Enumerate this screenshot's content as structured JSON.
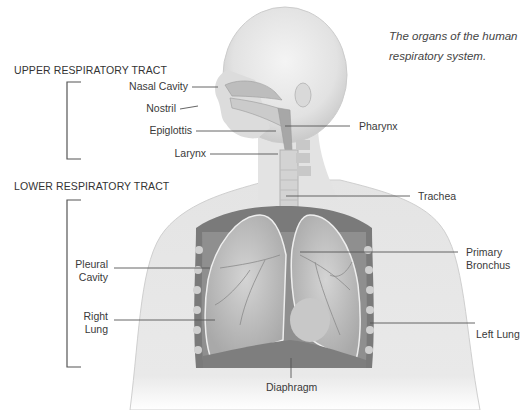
{
  "caption": {
    "line1": "The organs of the human",
    "line2": "respiratory system."
  },
  "sections": {
    "upper": "UPPER RESPIRATORY TRACT",
    "lower": "LOWER RESPIRATORY TRACT"
  },
  "labels": {
    "nasal_cavity": "Nasal Cavity",
    "nostril": "Nostril",
    "epiglottis": "Epiglottis",
    "larynx": "Larynx",
    "pharynx": "Pharynx",
    "trachea": "Trachea",
    "pleural_cavity_1": "Pleural",
    "pleural_cavity_2": "Cavity",
    "right_lung_1": "Right",
    "right_lung_2": "Lung",
    "primary_bronchus_1": "Primary",
    "primary_bronchus_2": "Bronchus",
    "left_lung": "Left Lung",
    "diaphragm": "Diaphragm"
  },
  "colors": {
    "line": "#555555",
    "body": "#e6e6e6",
    "lung": "#bdbdbd",
    "dark": "#555555"
  }
}
